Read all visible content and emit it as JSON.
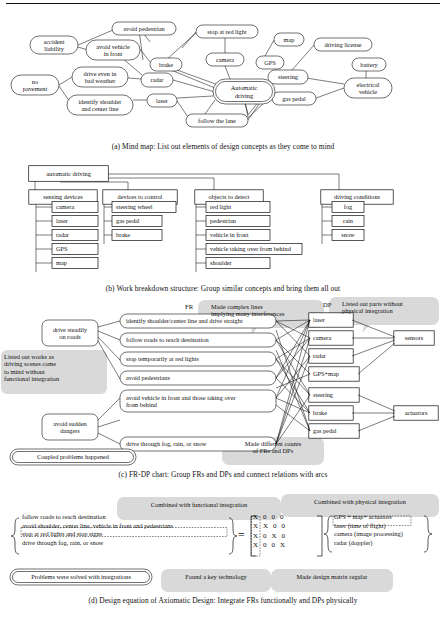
{
  "figure": {
    "panels": [
      {
        "id": "a",
        "caption": "(a) Mind map: List out elements of design concepts as they come to mind",
        "type": "mind-map",
        "center_node": "Automatic\ndriving",
        "nodes": [
          {
            "label": "avoid pedestrian",
            "x": 112,
            "y": 22,
            "w": 64,
            "h": 13
          },
          {
            "label": "accident\nliability",
            "x": 30,
            "y": 36,
            "w": 48,
            "h": 18
          },
          {
            "label": "avoid vehicle\nin front",
            "x": 86,
            "y": 40,
            "w": 54,
            "h": 20
          },
          {
            "label": "stop at red light",
            "x": 196,
            "y": 25,
            "w": 62,
            "h": 13
          },
          {
            "label": "map",
            "x": 274,
            "y": 33,
            "w": 30,
            "h": 13
          },
          {
            "label": "driving license",
            "x": 314,
            "y": 38,
            "w": 58,
            "h": 13
          },
          {
            "label": "brake",
            "x": 150,
            "y": 58,
            "w": 32,
            "h": 13
          },
          {
            "label": "camera",
            "x": 206,
            "y": 53,
            "w": 38,
            "h": 13
          },
          {
            "label": "GPS",
            "x": 256,
            "y": 56,
            "w": 28,
            "h": 13
          },
          {
            "label": "battery",
            "x": 352,
            "y": 58,
            "w": 34,
            "h": 13
          },
          {
            "label": "drive even in\nbad weather",
            "x": 72,
            "y": 67,
            "w": 56,
            "h": 20
          },
          {
            "label": "radar",
            "x": 141,
            "y": 73,
            "w": 32,
            "h": 14
          },
          {
            "label": "steering",
            "x": 268,
            "y": 70,
            "w": 40,
            "h": 14
          },
          {
            "label": "no\npavement",
            "x": 11,
            "y": 75,
            "w": 48,
            "h": 20
          },
          {
            "label": "electrical\nvehicle",
            "x": 344,
            "y": 78,
            "w": 48,
            "h": 20
          },
          {
            "label": "identify shoulder\nand center line",
            "x": 67,
            "y": 95,
            "w": 66,
            "h": 20
          },
          {
            "label": "laser",
            "x": 147,
            "y": 94,
            "w": 30,
            "h": 13
          },
          {
            "label": "gas pedal",
            "x": 272,
            "y": 92,
            "w": 44,
            "h": 13
          },
          {
            "label": "follow the lane",
            "x": 186,
            "y": 114,
            "w": 62,
            "h": 13
          }
        ]
      },
      {
        "id": "b",
        "caption": "(b) Work breakdown structure: Group similar concepts and bring them all out",
        "type": "work-breakdown-structure",
        "root": "automatic driving",
        "groups": [
          {
            "title": "sensing devices",
            "items": [
              "camera",
              "laser",
              "radar",
              "GPS",
              "map"
            ]
          },
          {
            "title": "devices to control",
            "items": [
              "steering wheel",
              "gas pedal",
              "brake"
            ]
          },
          {
            "title": "objects to detect",
            "items": [
              "red light",
              "pedestrian",
              "vehicle in front",
              "vehicle taking over from behind",
              "shoulder"
            ]
          },
          {
            "title": "driving conditions",
            "items": [
              "fog",
              "rain",
              "snow"
            ]
          }
        ]
      },
      {
        "id": "c",
        "caption": "(c) FR-DP chart: Group FRs and DPs and connect relations with arcs",
        "type": "fr-dp-chart",
        "fr_header": "FR",
        "dp_header": "DP",
        "left_groups": [
          "drive steadily\non roads",
          "avoid sudden\ndangers"
        ],
        "frs": [
          "identify shoulder/center line and drive straight",
          "follow roads to reach destination",
          "stop temporarily at red lights",
          "avoid pedestrians",
          "avoid vehicle in front and those taking over\nfrom behind",
          "drive through fog, rain, or snow"
        ],
        "dps": [
          "laser",
          "camera",
          "radar",
          "GPS+map",
          "steering",
          "brake",
          "gas pedal"
        ],
        "right_groups": [
          "sensors",
          "actuators"
        ],
        "balloons": [
          "Made complex lines\nimplying many interferences",
          "Listed out parts without\nphysical integration",
          "Listed out works as\ndriving scenes come\nto mind without\nfunctional integration",
          "Made different counts\nof FRs and DPs"
        ],
        "conclusion": "Coupled problems happened"
      },
      {
        "id": "d",
        "caption": "(d) Design equation of Axiomatic Design: Integrate FRs functionally and DPs physically",
        "type": "design-equation",
        "balloon_left": "Combined with functional integration",
        "balloon_right": "Combined with physical integration",
        "fr_vector": [
          "follow roads to reach destination",
          "avoid shoulder, center line, vehicle in front and pedestrians",
          "stop at red lights and stop signs",
          "drive through fog, rain, or snow"
        ],
        "equals": "=",
        "matrix": [
          [
            "X",
            "0",
            "0",
            "0"
          ],
          [
            "X",
            "X",
            "0",
            "0"
          ],
          [
            "X",
            "0",
            "X",
            "0"
          ],
          [
            "X",
            "0",
            "0",
            "X"
          ]
        ],
        "dp_vector": [
          "GPS + map+ actuators",
          "laser (time of flight)",
          "camera (image processing)",
          "radar (doppler)"
        ],
        "conclusion": "Problems were solved with integrations",
        "notes": [
          "Found a key technology",
          "Made design matrix regular"
        ]
      }
    ]
  },
  "colors": {
    "ink": "#111111",
    "balloon": "#d8d8d8",
    "paper": "#ffffff"
  }
}
